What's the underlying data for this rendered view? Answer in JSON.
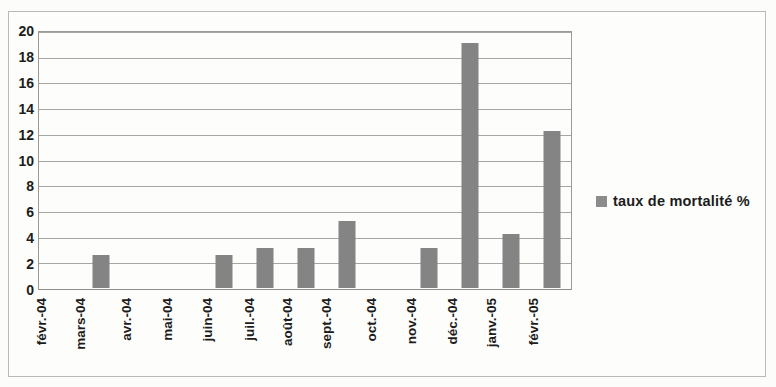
{
  "chart_data": {
    "type": "bar",
    "title": "",
    "subtitle": "",
    "xlabel": "",
    "ylabel": "",
    "categories": [
      "févr.-04",
      "mars-04",
      "avr.-04",
      "mai-04",
      "juin-04",
      "juil.-04",
      "août-04",
      "sept.-04",
      "oct.-04",
      "nov.-04",
      "déc.-04",
      "janv.-05",
      "févr.-05"
    ],
    "values": [
      0,
      2.6,
      0,
      0,
      2.6,
      3.1,
      3.1,
      5.2,
      0,
      3.1,
      19.1,
      4.2,
      12.2
    ],
    "series": [
      {
        "name": "taux de mortalité %",
        "values": [
          0,
          2.6,
          0,
          0,
          2.6,
          3.1,
          3.1,
          5.2,
          0,
          3.1,
          19.1,
          4.2,
          12.2
        ],
        "color": "#848484"
      }
    ],
    "ylim": [
      0,
      20
    ],
    "ytick_step": 2,
    "yticks": [
      0,
      2,
      4,
      6,
      8,
      10,
      12,
      14,
      16,
      18,
      20
    ],
    "ytick_labels": [
      "0",
      "2",
      "4",
      "6",
      "8",
      "10",
      "12",
      "14",
      "16",
      "18",
      "20"
    ],
    "grid": true,
    "grid_axis": "y",
    "legend": {
      "position": "right",
      "entries": [
        {
          "label": "taux de mortalité %",
          "color": "#8c8c8c"
        }
      ]
    },
    "bar_color": "#848484",
    "plot_background": "#fdfdfb",
    "axis_color": "#9a9a96",
    "gridline_color": "#a6a6a2",
    "text_color": "#1c1c1c",
    "xtick_rotation": -90
  }
}
